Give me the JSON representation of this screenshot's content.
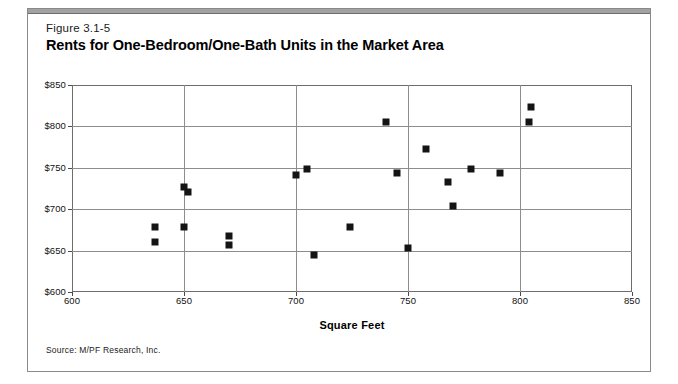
{
  "figure": {
    "number": "Figure 3.1-5",
    "title": "Rents for One-Bedroom/One-Bath Units in the Market Area",
    "source": "Source: M/PF Research, Inc."
  },
  "colors": {
    "marker": "#141414",
    "gridline": "#8d8d8d",
    "frame": "#6d6d6d",
    "top_rule": "#a2a2a2"
  },
  "chart_data": {
    "type": "scatter",
    "title": "Rents for One-Bedroom/One-Bath Units in the Market Area",
    "xlabel": "Square Feet",
    "ylabel": "",
    "xlim": [
      600,
      850
    ],
    "ylim": [
      600,
      850
    ],
    "xticks": [
      600,
      650,
      700,
      750,
      800,
      850
    ],
    "yticks": [
      600,
      650,
      700,
      750,
      800,
      850
    ],
    "xtick_labels": [
      "600",
      "650",
      "700",
      "750",
      "800",
      "850"
    ],
    "ytick_labels": [
      "$600",
      "$650",
      "$700",
      "$750",
      "$800",
      "$850"
    ],
    "grid": true,
    "legend": false,
    "points": [
      {
        "x": 637,
        "y": 678
      },
      {
        "x": 637,
        "y": 660
      },
      {
        "x": 650,
        "y": 727
      },
      {
        "x": 652,
        "y": 721
      },
      {
        "x": 650,
        "y": 678
      },
      {
        "x": 670,
        "y": 668
      },
      {
        "x": 670,
        "y": 657
      },
      {
        "x": 700,
        "y": 741
      },
      {
        "x": 705,
        "y": 749
      },
      {
        "x": 708,
        "y": 645
      },
      {
        "x": 724,
        "y": 678
      },
      {
        "x": 740,
        "y": 805
      },
      {
        "x": 745,
        "y": 744
      },
      {
        "x": 750,
        "y": 653
      },
      {
        "x": 758,
        "y": 773
      },
      {
        "x": 768,
        "y": 733
      },
      {
        "x": 770,
        "y": 704
      },
      {
        "x": 778,
        "y": 749
      },
      {
        "x": 791,
        "y": 744
      },
      {
        "x": 805,
        "y": 823
      },
      {
        "x": 804,
        "y": 805
      }
    ]
  }
}
